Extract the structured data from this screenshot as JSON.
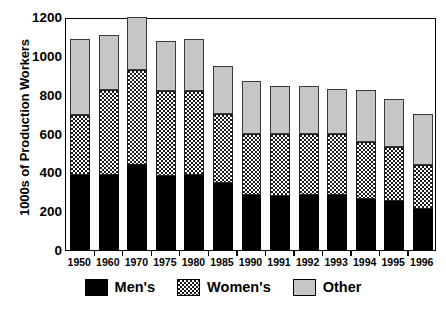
{
  "chart_data": {
    "type": "bar",
    "subtype": "stacked-bar",
    "title": "",
    "xlabel": "",
    "ylabel": "1000s of Production Workers",
    "ylim": [
      0,
      1200
    ],
    "yticks": [
      0,
      200,
      400,
      600,
      800,
      1000,
      1200
    ],
    "ytick_labels": [
      "0",
      "200",
      "400",
      "600",
      "800",
      "1000",
      "1200"
    ],
    "grid": false,
    "legend_position": "bottom",
    "categories": [
      "1950",
      "1960",
      "1970",
      "1975",
      "1980",
      "1985",
      "1990",
      "1991",
      "1992",
      "1993",
      "1994",
      "1995",
      "1996"
    ],
    "series": [
      {
        "name": "Men's",
        "color": "#000000",
        "pattern": "solid",
        "values": [
          385,
          385,
          440,
          380,
          385,
          345,
          285,
          280,
          285,
          285,
          265,
          250,
          210
        ]
      },
      {
        "name": "Women's",
        "color": "#7d7d7d",
        "pattern": "crosshatch",
        "values": [
          310,
          440,
          485,
          440,
          435,
          355,
          315,
          320,
          315,
          310,
          290,
          280,
          230
        ]
      },
      {
        "name": "Other",
        "color": "#c6c6c6",
        "pattern": "solid",
        "values": [
          390,
          280,
          275,
          255,
          265,
          250,
          270,
          245,
          245,
          235,
          270,
          250,
          260
        ]
      }
    ],
    "totals": [
      1085,
      1105,
      1200,
      1075,
      1085,
      950,
      870,
      845,
      845,
      830,
      825,
      780,
      700
    ]
  },
  "legend": {
    "entries": [
      {
        "label": "Men's",
        "swatch": "black-swatch"
      },
      {
        "label": "Women's",
        "swatch": "hatched-swatch"
      },
      {
        "label": "Other",
        "swatch": "gray-swatch"
      }
    ]
  }
}
